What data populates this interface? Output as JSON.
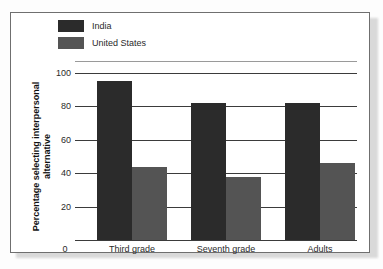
{
  "chart_data": {
    "type": "bar",
    "title": "",
    "xlabel": "",
    "ylabel": "Percentage selecting interpersonal alternative",
    "ylim": [
      0,
      100
    ],
    "yticks": [
      0,
      20,
      40,
      60,
      80,
      100
    ],
    "grid": true,
    "legend_position": "top-left",
    "categories": [
      "Third grade",
      "Seventh grade",
      "Adults"
    ],
    "series": [
      {
        "name": "India",
        "color": "#2b2b2b",
        "values": [
          95,
          82,
          82
        ]
      },
      {
        "name": "United States",
        "color": "#545454",
        "values": [
          44,
          38,
          46
        ]
      }
    ]
  },
  "legend": {
    "items": [
      {
        "label": "India",
        "color": "#2b2b2b"
      },
      {
        "label": "United States",
        "color": "#545454"
      }
    ]
  },
  "axes": {
    "y_title_line1": "Percentage selecting interpersonal",
    "y_title_line2": "alternative",
    "y_tick_labels": [
      "0",
      "20",
      "40",
      "60",
      "80",
      "100"
    ],
    "x_tick_labels": [
      "Third grade",
      "Seventh grade",
      "Adults"
    ]
  }
}
